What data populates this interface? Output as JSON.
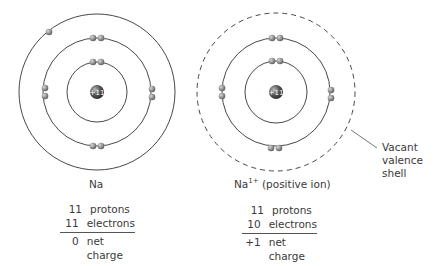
{
  "atom": {
    "label": "Na",
    "nucleus_label": "+11",
    "shells": [
      2,
      8,
      1
    ],
    "table": {
      "protons_num": "11",
      "protons_label": "protons",
      "electrons_num": "11",
      "electrons_label": "electrons",
      "net_num": "0",
      "net_label": "net charge"
    }
  },
  "ion": {
    "label_base": "Na",
    "label_sup": "1+",
    "label_suffix": " (positive ion)",
    "nucleus_label": "+11",
    "shells": [
      2,
      8,
      0
    ],
    "table": {
      "protons_num": "11",
      "protons_label": "protons",
      "electrons_num": "10",
      "electrons_label": "electrons",
      "net_num": "+1",
      "net_label": "net charge"
    }
  },
  "annotation": {
    "line1": "Vacant",
    "line2": "valence",
    "line3": "shell"
  },
  "colors": {
    "electron": "#8a8a8a",
    "nucleus": "#4a4a4a",
    "line": "#333333"
  }
}
